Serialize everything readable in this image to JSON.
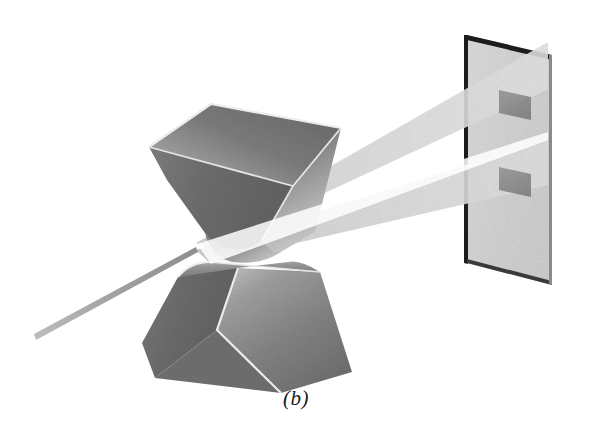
{
  "figure": {
    "caption": "(b)",
    "background_color": "#ffffff"
  },
  "scene": {
    "objects": [
      {
        "name": "upper-prism",
        "label": "Upper inverted prism",
        "orientation": "apex-down",
        "edge_style": "rounded-apex"
      },
      {
        "name": "lower-prism",
        "label": "Lower upright prism",
        "orientation": "apex-up",
        "edge_style": "rounded-ridge"
      },
      {
        "name": "screen",
        "label": "Projection screen",
        "shape": "parallelogram",
        "border_color": "#1c1c1c"
      }
    ],
    "beams": [
      {
        "name": "incident-ray",
        "label": "Incident light ray",
        "direction": "lower-left to prism junction"
      },
      {
        "name": "upper-beam-fan",
        "label": "Upper refracted beam fan",
        "direction": "prism junction to upper screen spot"
      },
      {
        "name": "lower-beam-fan",
        "label": "Lower refracted beam fan",
        "direction": "prism junction to lower screen spot"
      }
    ],
    "spots": [
      {
        "name": "upper-spot",
        "label": "Upper projected spot"
      },
      {
        "name": "lower-spot",
        "label": "Lower projected spot"
      }
    ]
  },
  "colors": {
    "prism_dark": "#6e6e6e",
    "prism_mid": "#8c8c8c",
    "prism_light": "#bdbdbd",
    "prism_highlight": "#e8e8e8",
    "screen_face": "#d8d8d8",
    "screen_edge": "#1c1c1c",
    "beam": "#d2d2d2",
    "spot": "#8a8a8a",
    "ray": "#9a9a9a",
    "caption_text": "#1a1a1a"
  }
}
